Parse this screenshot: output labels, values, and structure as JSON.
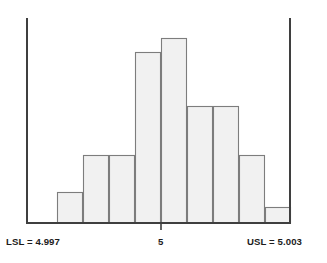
{
  "chart_data": {
    "type": "bar",
    "title": "",
    "subtitle": "",
    "xlabel": "",
    "ylabel": "",
    "grid": false,
    "legend": null,
    "xlim": [
      4.997,
      5.003
    ],
    "ylim": [
      0,
      26
    ],
    "x_tick_values": [
      5
    ],
    "x_tick_labels": [
      "5"
    ],
    "bin_edges": [
      4.9982,
      4.99865,
      4.9991,
      4.99955,
      5.0,
      5.00045,
      5.0009,
      5.00135,
      5.0018,
      5.00225
    ],
    "categories": [
      "bin-1",
      "bin-2",
      "bin-3",
      "bin-4",
      "bin-5",
      "bin-6",
      "bin-7",
      "bin-8",
      "bin-9"
    ],
    "values": [
      5,
      9,
      9,
      21,
      23,
      15,
      15,
      9,
      3
    ],
    "bar_pixel_tops": [
      192,
      155,
      155,
      52,
      38,
      106,
      106,
      155,
      207
    ],
    "bar_pixel_lefts": [
      57,
      83,
      109,
      135,
      161,
      187,
      213,
      239,
      265
    ],
    "bar_pixel_width": 26,
    "baseline_y": 223,
    "annotations": [
      {
        "name": "lower-spec-limit",
        "label": "LSL = 4.997",
        "value": 4.997,
        "x_pixel": 27,
        "orientation": "vertical-line"
      },
      {
        "name": "upper-spec-limit",
        "label": "USL = 5.003",
        "value": 5.003,
        "x_pixel": 290,
        "orientation": "vertical-line"
      }
    ]
  },
  "labels": {
    "lsl": "LSL = 4.997",
    "usl": "USL = 5.003",
    "center_tick": "5"
  },
  "colors": {
    "bar_fill": "#f1f1f1",
    "bar_stroke": "#7d7d7d",
    "axis": "#3f3f3f",
    "text": "#1c1c1c",
    "background": "#ffffff"
  }
}
